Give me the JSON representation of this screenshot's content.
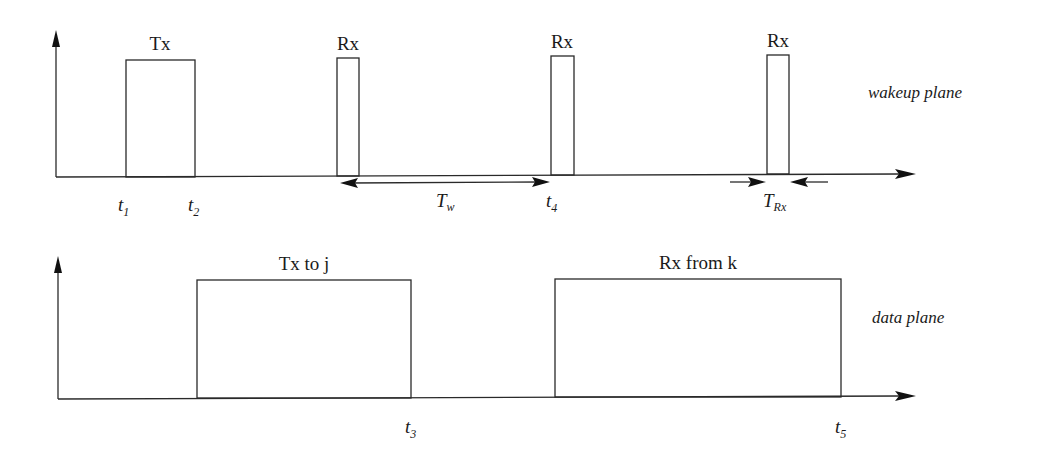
{
  "diagram": {
    "wakeup_plane": {
      "label": "wakeup plane",
      "pulses": [
        {
          "label": "Tx",
          "start": "t1",
          "end": "t2"
        },
        {
          "label": "Rx"
        },
        {
          "label": "Rx",
          "end": "t4"
        },
        {
          "label": "Rx"
        }
      ],
      "time_labels": {
        "t1": {
          "base": "t",
          "sub": "1"
        },
        "t2": {
          "base": "t",
          "sub": "2"
        },
        "t4": {
          "base": "t",
          "sub": "4"
        }
      },
      "intervals": {
        "tw": {
          "base": "T",
          "sub": "w",
          "description": "wakeup period between Rx pulses"
        },
        "trx": {
          "base": "T",
          "sub": "Rx",
          "description": "Rx pulse duration"
        }
      }
    },
    "data_plane": {
      "label": "data plane",
      "pulses": [
        {
          "label": "Tx to j",
          "end": "t3"
        },
        {
          "label": "Rx from k",
          "end": "t5"
        }
      ],
      "time_labels": {
        "t3": {
          "base": "t",
          "sub": "3"
        },
        "t5": {
          "base": "t",
          "sub": "5"
        }
      }
    },
    "colors": {
      "stroke": "#2a2a2a",
      "background": "#ffffff"
    }
  }
}
